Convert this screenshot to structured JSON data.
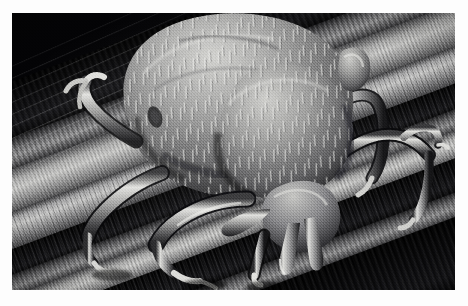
{
  "image": {
    "kind": "scanning-electron-micrograph",
    "title": "Scanning electron micrograph of a blood-feeding arthropod on textile fibres",
    "subject": "arthropod",
    "subject_detail": "bed-bug-like insect, lateral-oblique view, head lowered toward substrate",
    "substrate": "coarse woven textile fibre bundles running diagonally lower-left to upper-right",
    "palette": {
      "border": "#ffffff",
      "background_black": "#05050a",
      "fibre_highlight": "#d6d6d4",
      "fibre_midtone": "#8e8e8f",
      "body_highlight": "#d8d8d6",
      "body_midtone": "#8a8a89",
      "body_shadow": "#2a2a2c",
      "seta_highlight": "#f2f2f0"
    },
    "color_mode": "grayscale",
    "visible_text": "",
    "layout": {
      "canvas_width": 468,
      "canvas_height": 306,
      "plate_left": 12,
      "plate_top": 13,
      "plate_width": 443,
      "plate_height": 277,
      "border_style": "plain white photographic margin"
    },
    "features": [
      {
        "name": "abdomen",
        "note": "large rounded dorsal mass, upper-centre, densely covered with short pale setae"
      },
      {
        "name": "thorax",
        "note": "segmented lobe right of abdomen, smooth shield with scattered setae"
      },
      {
        "name": "head-and-mouthparts",
        "note": "lowered to the fibre surface at lower-centre-right"
      },
      {
        "name": "foreleg-left",
        "note": "grasping a fibre bundle at far left, tarsus splayed"
      },
      {
        "name": "midleg-left",
        "note": "extends down-left across the lit fibre band"
      },
      {
        "name": "hindleg-left",
        "note": "bent knee, tarsus planted on the fibre mid-frame"
      },
      {
        "name": "foreleg-right",
        "note": "reaching right into dark space, tarsal claw raised"
      },
      {
        "name": "midleg-right",
        "note": "long slender leg spanning the right dark field"
      },
      {
        "name": "setae",
        "note": "numerous short stiff bristles catching the electron-beam highlight"
      }
    ]
  }
}
